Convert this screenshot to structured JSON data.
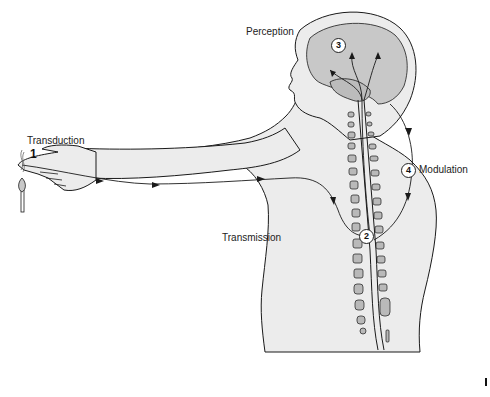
{
  "diagram": {
    "colors": {
      "skin": "#ececec",
      "brain": "#c8c8c8",
      "vertebra": "#b9b9b9",
      "outline": "#1a1a1a",
      "background": "#ffffff"
    },
    "stages": [
      {
        "number": "1",
        "label": "Transduction",
        "style": "plain-bold"
      },
      {
        "number": "2",
        "label": "Transmission",
        "style": "circled"
      },
      {
        "number": "3",
        "label": "Perception",
        "style": "circled"
      },
      {
        "number": "4",
        "label": "Modulation",
        "style": "circled"
      }
    ],
    "icons": [
      "lit-match-icon",
      "hand-icon",
      "arm-icon",
      "head-icon",
      "brain-icon",
      "spinal-cord-icon",
      "nerve-pathway-arrow-icon"
    ]
  }
}
